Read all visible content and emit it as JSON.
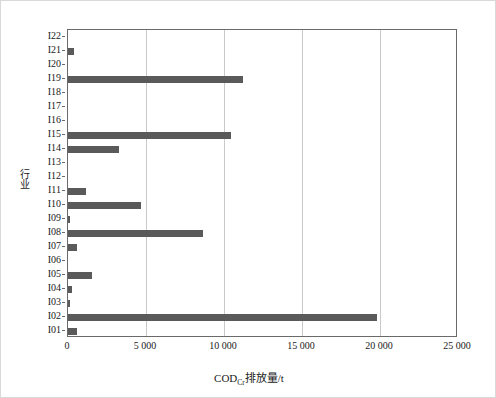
{
  "chart_data": {
    "type": "bar",
    "orientation": "horizontal",
    "title": "",
    "xlabel": "CODCr排放量/t",
    "xlabel_main": "COD",
    "xlabel_sub": "Cr",
    "xlabel_tail": "排放量/t",
    "ylabel": "行业",
    "categories": [
      "I01",
      "I02",
      "I03",
      "I04",
      "I05",
      "I06",
      "I07",
      "I08",
      "I09",
      "I10",
      "I11",
      "I12",
      "I13",
      "I14",
      "I15",
      "I16",
      "I17",
      "I18",
      "I19",
      "I20",
      "I21",
      "I22"
    ],
    "values": [
      580,
      19800,
      60,
      250,
      1540,
      0,
      580,
      8650,
      40,
      4680,
      1150,
      0,
      0,
      3270,
      10450,
      0,
      0,
      0,
      11200,
      0,
      400,
      0
    ],
    "xlim": [
      0,
      25000
    ],
    "xticks": [
      0,
      5000,
      10000,
      15000,
      20000,
      25000
    ],
    "xticklabels": [
      "0",
      "5 000",
      "10 000",
      "15 000",
      "20 000",
      "25 000"
    ],
    "grid": "vertical",
    "legend": "none",
    "bar_color": "#5a5a5a",
    "axis_color": "#6a6a6a",
    "grid_color": "#c9c9c9",
    "frame_color": "#d9d9d9"
  }
}
